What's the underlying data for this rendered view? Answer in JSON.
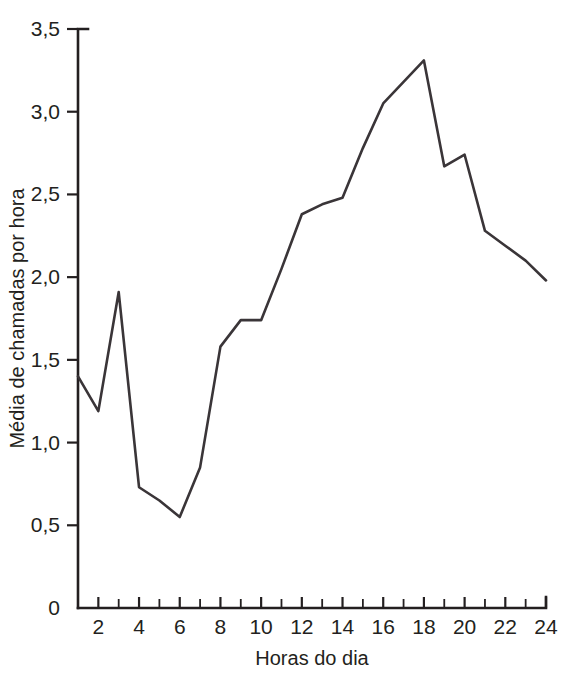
{
  "chart_data": {
    "type": "line",
    "title": "",
    "xlabel": "Horas do dia",
    "ylabel": "Média de chamadas por hora",
    "x": [
      1,
      2,
      3,
      4,
      5,
      6,
      7,
      8,
      9,
      10,
      11,
      12,
      13,
      14,
      15,
      16,
      17,
      18,
      19,
      20,
      21,
      22,
      23,
      24
    ],
    "values": [
      1.4,
      1.19,
      1.91,
      0.73,
      0.65,
      0.55,
      0.85,
      1.58,
      1.74,
      1.74,
      2.05,
      2.38,
      2.44,
      2.48,
      2.78,
      3.05,
      3.18,
      3.31,
      2.67,
      2.74,
      2.28,
      2.19,
      2.1,
      1.98
    ],
    "series": [
      {
        "name": "Média de chamadas por hora",
        "values": [
          1.4,
          1.19,
          1.91,
          0.73,
          0.65,
          0.55,
          0.85,
          1.58,
          1.74,
          1.74,
          2.05,
          2.38,
          2.44,
          2.48,
          2.78,
          3.05,
          3.18,
          3.31,
          2.67,
          2.74,
          2.28,
          2.19,
          2.1,
          1.98
        ],
        "color": "#3a3538"
      }
    ],
    "xlim": [
      1,
      24
    ],
    "ylim": [
      0,
      3.5
    ],
    "grid": false,
    "legend": false,
    "x_tick_labels": [
      "2",
      "4",
      "6",
      "8",
      "10",
      "12",
      "14",
      "16",
      "18",
      "20",
      "22",
      "24"
    ],
    "x_tick_values": [
      2,
      4,
      6,
      8,
      10,
      12,
      14,
      16,
      18,
      20,
      22,
      24
    ],
    "x_minor_ticks": [
      1,
      3,
      5,
      7,
      9,
      11,
      13,
      15,
      17,
      19,
      21,
      23
    ],
    "y_tick_labels": [
      "0",
      "0,5",
      "1,0",
      "1,5",
      "2,0",
      "2,5",
      "3,0",
      "3,5"
    ],
    "y_tick_values": [
      0,
      0.5,
      1.0,
      1.5,
      2.0,
      2.5,
      3.0,
      3.5
    ],
    "decimal_separator": ",",
    "line_color": "#3a3538",
    "axis_color": "#231f20",
    "background": "#ffffff"
  },
  "axes": {
    "y_title": "Média de chamadas por hora",
    "x_title": "Horas do dia"
  }
}
